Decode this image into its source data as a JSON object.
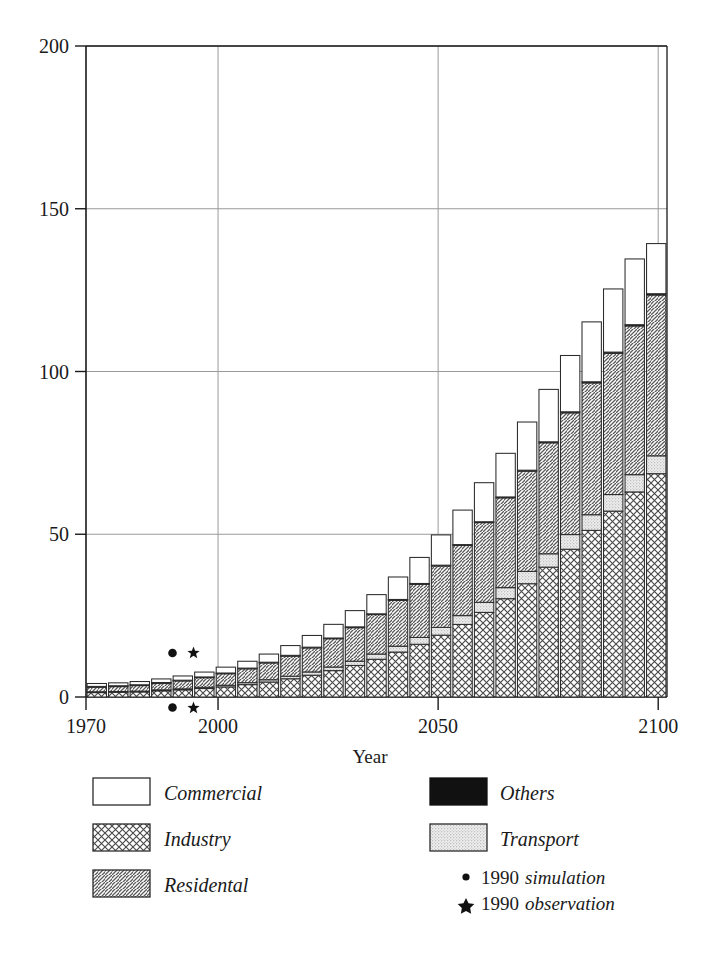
{
  "chart_data": {
    "type": "bar",
    "subtype": "stacked-bar",
    "title": "",
    "xlabel": "Year",
    "ylabel": "",
    "xlim": [
      1970,
      2102
    ],
    "ylim": [
      0,
      200
    ],
    "ytick_labels": [
      "0",
      "50",
      "100",
      "150",
      "200"
    ],
    "ytick_values": [
      0,
      50,
      100,
      150,
      200
    ],
    "xtick_labels": [
      "1970",
      "2000",
      "2050",
      "2100"
    ],
    "xtick_values": [
      1970,
      2000,
      2050,
      2100
    ],
    "grid": "horizontal-and-vertical-at-ticks",
    "legend_position": "below-axes",
    "stack_order_bottom_to_top": [
      "Industry",
      "Transport",
      "Residental",
      "Others",
      "Commercial"
    ],
    "categories": [
      1970,
      1975,
      1980,
      1985,
      1990,
      1995,
      2000,
      2005,
      2010,
      2015,
      2020,
      2025,
      2030,
      2035,
      2040,
      2045,
      2050,
      2055,
      2060,
      2065,
      2070,
      2075,
      2080,
      2085,
      2090,
      2095,
      2100
    ],
    "series": [
      {
        "name": "Industry",
        "pattern": "crosshatch",
        "values": [
          1.4,
          1.5,
          1.6,
          1.9,
          2.2,
          2.6,
          3.1,
          3.8,
          4.6,
          5.6,
          6.7,
          8.1,
          9.7,
          11.6,
          13.8,
          16.2,
          19.0,
          22.3,
          26.0,
          30.2,
          34.8,
          39.9,
          45.4,
          51.2,
          57.1,
          63.0,
          68.6
        ]
      },
      {
        "name": "Transport",
        "pattern": "stipple",
        "values": [
          0.2,
          0.2,
          0.2,
          0.3,
          0.3,
          0.4,
          0.5,
          0.6,
          0.7,
          0.8,
          1.0,
          1.1,
          1.3,
          1.6,
          1.8,
          2.1,
          2.4,
          2.7,
          3.1,
          3.4,
          3.8,
          4.1,
          4.5,
          4.8,
          5.1,
          5.3,
          5.5
        ]
      },
      {
        "name": "Residental",
        "pattern": "diagonal-hatch",
        "values": [
          1.6,
          1.7,
          1.9,
          2.2,
          2.6,
          3.1,
          3.7,
          4.4,
          5.3,
          6.3,
          7.5,
          8.8,
          10.4,
          12.2,
          14.2,
          16.4,
          18.9,
          21.6,
          24.5,
          27.6,
          30.8,
          34.1,
          37.4,
          40.5,
          43.4,
          45.7,
          49.4
        ]
      },
      {
        "name": "Others",
        "pattern": "solid-black",
        "values": [
          0.05,
          0.05,
          0.05,
          0.05,
          0.06,
          0.06,
          0.07,
          0.08,
          0.09,
          0.1,
          0.11,
          0.12,
          0.14,
          0.15,
          0.17,
          0.18,
          0.2,
          0.22,
          0.24,
          0.26,
          0.28,
          0.3,
          0.32,
          0.34,
          0.36,
          0.38,
          0.4
        ]
      },
      {
        "name": "Commercial",
        "pattern": "white",
        "values": [
          0.9,
          0.9,
          1.0,
          1.1,
          1.3,
          1.5,
          1.8,
          2.1,
          2.5,
          3.0,
          3.6,
          4.2,
          5.0,
          5.9,
          6.9,
          8.0,
          9.3,
          10.6,
          12.0,
          13.4,
          14.8,
          16.1,
          17.3,
          18.4,
          19.4,
          20.2,
          15.4
        ]
      }
    ],
    "totals": [
      4.15,
      4.35,
      4.75,
      5.55,
      6.46,
      7.66,
      9.17,
      11.0,
      13.2,
      15.8,
      18.9,
      22.3,
      26.5,
      31.5,
      36.9,
      42.9,
      49.8,
      57.4,
      65.8,
      74.9,
      84.5,
      94.5,
      104.9,
      115.2,
      125.4,
      134.6,
      139.3
    ],
    "markers": [
      {
        "name": "1990 simulation",
        "glyph": "dot",
        "x": 1990,
        "positions_shown": [
          "above-axis",
          "below-axis"
        ]
      },
      {
        "name": "1990 observation",
        "glyph": "star",
        "x": 1991,
        "positions_shown": [
          "above-axis",
          "below-axis"
        ]
      }
    ]
  },
  "legend": {
    "left_column": [
      {
        "label": "Commercial",
        "pattern": "white"
      },
      {
        "label": "Industry",
        "pattern": "crosshatch"
      },
      {
        "label": "Residental",
        "pattern": "diagonal-hatch"
      }
    ],
    "right_column": [
      {
        "label": "Others",
        "pattern": "solid-black"
      },
      {
        "label": "Transport",
        "pattern": "stipple"
      }
    ],
    "marker_entries": [
      {
        "glyph": "•",
        "year": "1990",
        "label": "simulation"
      },
      {
        "glyph": "★",
        "year": "1990",
        "label": "observation"
      }
    ]
  },
  "colors": {
    "axis": "#1a1a1a",
    "grid": "#9a9a9a",
    "bar_outline": "#2b2b2b",
    "hatch": "#555555",
    "black_fill": "#111111",
    "stipple_bg": "#e8e8e8",
    "background": "#ffffff"
  }
}
